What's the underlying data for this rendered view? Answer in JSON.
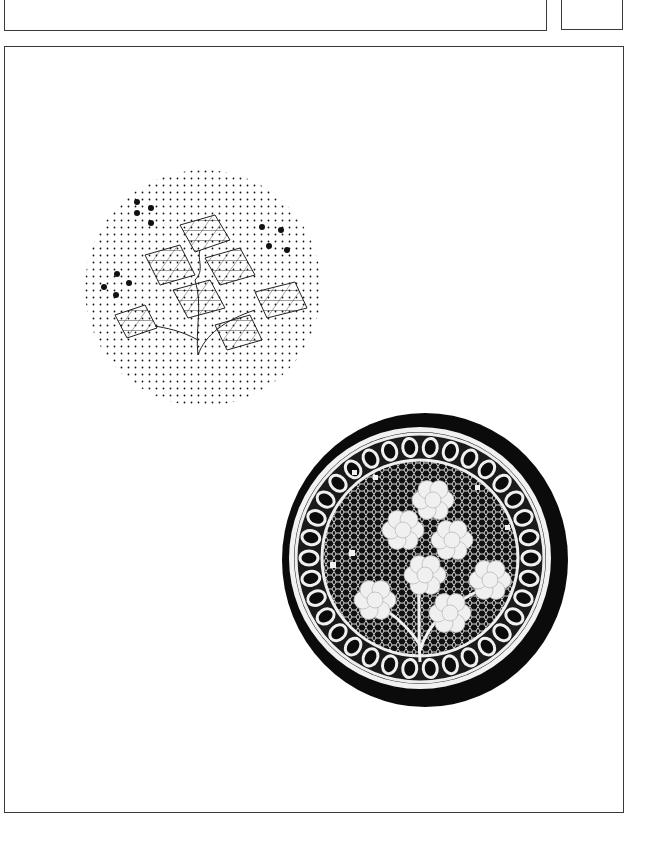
{
  "page": {
    "background": "#ffffff",
    "frame_color": "#3a3a3a"
  },
  "figures": [
    {
      "id": "pricking",
      "label": "",
      "description": "Lace pricking pattern: circular dotted ground with ring of loops, diamond-grid flower motifs on branching stem"
    },
    {
      "id": "lace-photo",
      "label": "",
      "description": "Photograph of finished circular lace mat on black background with floral motifs"
    }
  ]
}
